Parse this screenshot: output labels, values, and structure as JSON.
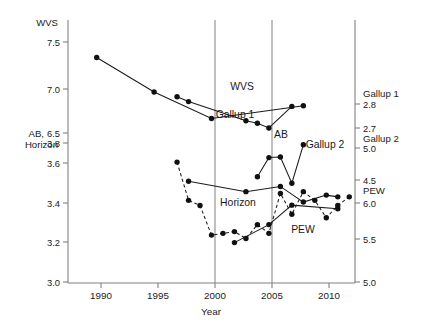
{
  "chart_data": {
    "type": "line",
    "title": "",
    "xlabel": "Year",
    "ylabel": "",
    "grid": false,
    "legend_position": "inline-labels",
    "xlim": [
      1987.5,
      2012.5
    ],
    "x_ticks": [
      "1990",
      "1995",
      "2000",
      "2005",
      "2010"
    ],
    "x_tick_values": [
      1990,
      1995,
      2000,
      2005,
      2010
    ],
    "vertical_reference_lines": [
      2000,
      2005
    ],
    "left_axes": [
      {
        "name": "WVS",
        "ticks": [
          "7.5",
          "7.0",
          "6.5"
        ],
        "tick_values": [
          7.5,
          7.0,
          6.5
        ],
        "range": [
          6.5,
          7.5
        ]
      },
      {
        "name": "AB, Horizon",
        "ticks": [
          "3.8",
          "3.6",
          "3.4",
          "3.2",
          "3.0"
        ],
        "tick_values": [
          3.8,
          3.6,
          3.4,
          3.2,
          3.0
        ],
        "range": [
          3.0,
          3.8
        ]
      }
    ],
    "right_axes": [
      {
        "name": "Gallup 1",
        "ticks": [
          "2.8",
          "2.7"
        ],
        "tick_values": [
          2.8,
          2.7
        ]
      },
      {
        "name": "Gallup 2",
        "ticks": [
          "5.0",
          "4.5"
        ],
        "tick_values": [
          5.0,
          4.5
        ]
      },
      {
        "name": "PEW",
        "ticks": [
          "6.0",
          "5.5",
          "5.0"
        ],
        "tick_values": [
          6.0,
          5.5,
          5.0
        ]
      }
    ],
    "series": [
      {
        "name": "WVS",
        "style": "solid",
        "label": "WVS",
        "scale": "WVS (left)",
        "points": [
          {
            "x": 1990,
            "y": 7.33
          },
          {
            "x": 1995,
            "y": 6.95
          },
          {
            "x": 2000,
            "y": 6.66
          },
          {
            "x": 2008,
            "y": 6.8
          }
        ]
      },
      {
        "name": "Gallup 1",
        "style": "solid",
        "label": "Gallup 1",
        "scale": "Gallup 1 (right)",
        "points": [
          {
            "x": 1997,
            "y": 2.83
          },
          {
            "x": 1998,
            "y": 2.81
          },
          {
            "x": 2003,
            "y": 2.73
          },
          {
            "x": 2004,
            "y": 2.72
          },
          {
            "x": 2005,
            "y": 2.7
          },
          {
            "x": 2007,
            "y": 2.79
          }
        ]
      },
      {
        "name": "AB",
        "style": "solid",
        "label": "AB",
        "scale": "AB (left)",
        "points": [
          {
            "x": 1998,
            "y": 3.58
          },
          {
            "x": 2003,
            "y": 3.52
          },
          {
            "x": 2006,
            "y": 3.55
          },
          {
            "x": 2008,
            "y": 3.46
          },
          {
            "x": 2010,
            "y": 3.5
          },
          {
            "x": 2011,
            "y": 3.49
          }
        ]
      },
      {
        "name": "Gallup 2",
        "style": "solid",
        "label": "Gallup 2",
        "scale": "Gallup 2 (right)",
        "points": [
          {
            "x": 2004,
            "y": 4.55
          },
          {
            "x": 2005,
            "y": 4.85
          },
          {
            "x": 2006,
            "y": 4.86
          },
          {
            "x": 2007,
            "y": 4.45
          },
          {
            "x": 2008,
            "y": 5.05
          }
        ]
      },
      {
        "name": "Horizon",
        "style": "dashed",
        "label": "Horizon",
        "scale": "Horizon (left)",
        "points": [
          {
            "x": 1997,
            "y": 3.69
          },
          {
            "x": 1998,
            "y": 3.47
          },
          {
            "x": 1999,
            "y": 3.44
          },
          {
            "x": 2000,
            "y": 3.27
          },
          {
            "x": 2001,
            "y": 3.28
          },
          {
            "x": 2002,
            "y": 3.29
          },
          {
            "x": 2003,
            "y": 3.25
          },
          {
            "x": 2004,
            "y": 3.33
          },
          {
            "x": 2005,
            "y": 3.28
          },
          {
            "x": 2006,
            "y": 3.51
          },
          {
            "x": 2007,
            "y": 3.39
          },
          {
            "x": 2008,
            "y": 3.52
          },
          {
            "x": 2009,
            "y": 3.47
          },
          {
            "x": 2010,
            "y": 3.37
          },
          {
            "x": 2011,
            "y": 3.44
          },
          {
            "x": 2012,
            "y": 3.49
          }
        ]
      },
      {
        "name": "PEW",
        "style": "solid",
        "label": "PEW",
        "scale": "PEW (right)",
        "points": [
          {
            "x": 2002,
            "y": 5.45
          },
          {
            "x": 2005,
            "y": 5.7
          },
          {
            "x": 2007,
            "y": 5.97
          },
          {
            "x": 2011,
            "y": 5.92
          }
        ]
      }
    ],
    "series_labels": [
      {
        "text": "WVS",
        "x": 242,
        "y": 90
      },
      {
        "text": "Gallup 1",
        "x": 235,
        "y": 118
      },
      {
        "text": "AB",
        "x": 281,
        "y": 138
      },
      {
        "text": "Gallup 2",
        "x": 325,
        "y": 148
      },
      {
        "text": "Horizon",
        "x": 238,
        "y": 206
      },
      {
        "text": "PEW",
        "x": 303,
        "y": 233
      }
    ]
  },
  "axis_text": {
    "left_top_name": "WVS",
    "left_bottom_name_line1": "AB,",
    "left_bottom_name_line2": "Horizon",
    "right_gallup1": "Gallup 1",
    "right_gallup2": "Gallup 2",
    "right_pew": "PEW",
    "left_ticks": [
      "7.5",
      "7.0",
      "6.5",
      "3.8",
      "3.6",
      "3.4",
      "3.2",
      "3.0"
    ],
    "right_ticks": [
      "2.8",
      "2.7",
      "5.0",
      "4.5",
      "6.0",
      "5.5",
      "5.0"
    ],
    "x_ticks": [
      "1990",
      "1995",
      "2000",
      "2005",
      "2010"
    ],
    "x_axis_title": "Year"
  }
}
